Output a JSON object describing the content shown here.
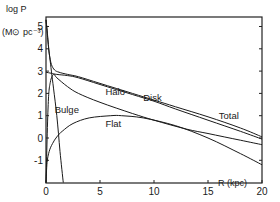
{
  "chart_data": {
    "type": "line",
    "title": "",
    "xlabel": "R (kpc)",
    "ylabel": "log P",
    "yunit": "(M⊙ pc⁻³)",
    "xlim": [
      0,
      20
    ],
    "ylim": [
      -2,
      5.5
    ],
    "xticks": [
      0,
      5,
      10,
      15,
      20
    ],
    "xtick_labels": [
      "0",
      "5",
      "10",
      "15",
      "20"
    ],
    "yticks": [
      -1,
      0,
      1,
      2,
      3,
      4,
      5
    ],
    "ytick_labels": [
      "-1",
      "0",
      "1",
      "2",
      "3",
      "4",
      "5"
    ],
    "grid": false,
    "series": [
      {
        "name": "Total",
        "x": [
          0,
          0.15,
          0.3,
          0.5,
          0.8,
          1.2,
          2,
          3,
          5,
          8,
          10,
          12,
          15,
          18,
          20
        ],
        "y": [
          5.3,
          4.6,
          3.8,
          3.3,
          3.05,
          2.95,
          2.85,
          2.75,
          2.45,
          2.0,
          1.7,
          1.4,
          0.95,
          0.45,
          0.05
        ]
      },
      {
        "name": "Disk",
        "x": [
          0,
          0.5,
          1,
          2,
          3,
          5,
          8,
          10,
          12,
          15,
          18,
          20
        ],
        "y": [
          2.95,
          2.9,
          2.85,
          2.8,
          2.7,
          2.4,
          1.95,
          1.65,
          1.3,
          0.8,
          0.3,
          -0.05
        ]
      },
      {
        "name": "Halo",
        "x": [
          0,
          0.2,
          0.4,
          0.7,
          1,
          2,
          3,
          5,
          8,
          10,
          13,
          15,
          18,
          20
        ],
        "y": [
          -2,
          1.5,
          2.5,
          2.85,
          2.7,
          2.3,
          2.0,
          1.6,
          1.1,
          0.8,
          0.4,
          0.2,
          -0.1,
          -0.3
        ]
      },
      {
        "name": "Bulge",
        "x": [
          0,
          0.1,
          0.2,
          0.35,
          0.5,
          0.7,
          1.0,
          1.3,
          1.6
        ],
        "y": [
          5.3,
          4.8,
          4.2,
          3.6,
          3.0,
          2.2,
          1.0,
          -0.6,
          -2
        ]
      },
      {
        "name": "Flat",
        "x": [
          0,
          0.1,
          0.3,
          0.6,
          1,
          1.5,
          2.5,
          4,
          6,
          7,
          9,
          12,
          15,
          18,
          20
        ],
        "y": [
          -2,
          -1.1,
          -0.6,
          -0.25,
          0.05,
          0.3,
          0.65,
          0.9,
          1.0,
          1.0,
          0.9,
          0.55,
          0.0,
          -0.7,
          -1.2
        ]
      }
    ],
    "annotations": [
      {
        "text": "Halo",
        "x": 5.5,
        "y": 1.95
      },
      {
        "text": "Disk",
        "x": 9.0,
        "y": 1.65
      },
      {
        "text": "Bulge",
        "x": 0.8,
        "y": 1.1
      },
      {
        "text": "Flat",
        "x": 5.5,
        "y": 0.5
      },
      {
        "text": "Total",
        "x": 16.0,
        "y": 0.85
      }
    ],
    "legend": "none"
  }
}
